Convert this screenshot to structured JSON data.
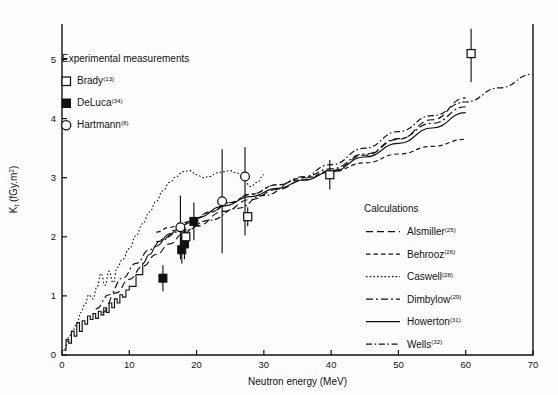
{
  "figure": {
    "name": "neutron-kerma-figure",
    "background": "#ffffff",
    "ink_color": "#111111"
  },
  "axes": {
    "x": {
      "label": "Neutron energy (MeV)",
      "min": 0,
      "max": 70,
      "ticks": [
        "0",
        "10",
        "20",
        "30",
        "40",
        "50",
        "60",
        "70"
      ],
      "tick_values": [
        0,
        10,
        20,
        30,
        40,
        50,
        60,
        70
      ]
    },
    "y": {
      "label_main": "K",
      "label_sub": "t",
      "label_units_open": " (fGy.m",
      "label_units_sup": "2",
      "label_units_close": ")",
      "label_full": "Kt (fGy.m2)",
      "min": 0,
      "max": 5.6,
      "ticks": [
        "0",
        "1",
        "2",
        "3",
        "4",
        "5"
      ],
      "tick_values": [
        0,
        1,
        2,
        3,
        4,
        5
      ]
    }
  },
  "legend_experimental": {
    "heading": "Experimental measurements",
    "items": [
      {
        "label": "Brady",
        "ref": "(13)",
        "marker": "open-square"
      },
      {
        "label": "DeLuca",
        "ref": "(34)",
        "marker": "filled-square"
      },
      {
        "label": "Hartmann",
        "ref": "(8)",
        "marker": "open-circle"
      }
    ]
  },
  "legend_calculations": {
    "heading": "Calculations",
    "items": [
      {
        "label": "Alsmiller",
        "ref": "(25)",
        "dash": "7 4",
        "width": 1.15
      },
      {
        "label": "Behrooz",
        "ref": "(26)",
        "dash": "4.5 3",
        "width": 1.15
      },
      {
        "label": "Caswell",
        "ref": "(28)",
        "dash": "1.6 2.1",
        "width": 1.1
      },
      {
        "label": "Dimbylow",
        "ref": "(29)",
        "dash": "7 3 2 3",
        "width": 1.15
      },
      {
        "label": "Howerton",
        "ref": "(31)",
        "dash": "none",
        "width": 1.15
      },
      {
        "label": "Wells",
        "ref": "(32)",
        "dash": "6 2.6 1.6 2.6",
        "width": 1.2
      }
    ]
  },
  "chart_data": {
    "type": "line",
    "title": "",
    "xlabel": "Neutron energy (MeV)",
    "ylabel": "Kt (fGy.m2)",
    "xlim": [
      0,
      70
    ],
    "ylim": [
      0,
      5.6
    ],
    "grid": false,
    "legend_position": "inside-upper-left and inside-lower-right",
    "series": [
      {
        "name": "Alsmiller",
        "ref": "(25)",
        "style": "dashed",
        "x": [
          6.0,
          8.0,
          10.0,
          12.0,
          14.0,
          16.0,
          18.0,
          20.0,
          24.0,
          28.0,
          32.0,
          36.0,
          40.0,
          45.0,
          50.0,
          55.0,
          60.0
        ],
        "y": [
          0.72,
          1.05,
          1.28,
          1.5,
          1.7,
          1.88,
          2.05,
          2.18,
          2.43,
          2.63,
          2.8,
          2.96,
          3.12,
          3.38,
          3.65,
          3.98,
          4.35
        ]
      },
      {
        "name": "Behrooz",
        "ref": "(26)",
        "style": "dashed-short",
        "x": [
          14.0,
          16.0,
          18.0,
          20.0,
          22.0,
          25.0,
          28.0,
          32.0,
          36.0,
          40.0,
          45.0,
          50.0,
          55.0,
          60.0
        ],
        "y": [
          2.08,
          2.16,
          2.24,
          2.32,
          2.42,
          2.58,
          2.72,
          2.88,
          3.0,
          3.1,
          3.25,
          3.4,
          3.53,
          3.65
        ]
      },
      {
        "name": "Caswell",
        "ref": "(28)",
        "style": "dotted",
        "x": [
          0.4,
          1.0,
          1.6,
          2.2,
          2.8,
          3.4,
          4.0,
          4.6,
          5.2,
          5.8,
          6.4,
          7.0,
          7.6,
          8.2,
          9.0,
          10.0,
          11.0,
          12.0,
          13.0,
          14.0,
          15.0,
          16.0,
          17.0,
          18.0,
          19.0,
          20.0,
          21.0,
          22.0,
          23.0,
          24.0,
          25.0,
          26.0,
          27.0,
          28.0,
          29.0,
          30.0
        ],
        "y": [
          0.1,
          0.3,
          0.42,
          0.52,
          0.72,
          0.85,
          1.02,
          0.95,
          1.15,
          1.38,
          1.18,
          1.42,
          1.22,
          1.48,
          1.62,
          1.8,
          2.02,
          2.22,
          2.42,
          2.6,
          2.78,
          2.92,
          3.02,
          3.1,
          3.12,
          3.05,
          3.0,
          3.02,
          3.08,
          3.1,
          3.12,
          3.08,
          2.98,
          2.85,
          2.92,
          3.05
        ]
      },
      {
        "name": "Dimbylow",
        "ref": "(29)",
        "style": "dash-dot",
        "x": [
          5.0,
          7.0,
          9.0,
          11.0,
          13.0,
          15.0,
          17.0,
          19.0,
          22.0,
          25.0,
          28.0,
          32.0,
          36.0,
          40.0,
          45.0,
          50.0,
          55.0,
          60.0
        ],
        "y": [
          0.78,
          1.02,
          1.3,
          1.55,
          1.78,
          1.96,
          2.12,
          2.24,
          2.42,
          2.58,
          2.72,
          2.88,
          3.02,
          3.15,
          3.4,
          3.66,
          3.92,
          4.2
        ]
      },
      {
        "name": "Howerton",
        "ref": "(31)",
        "style": "solid",
        "note": "jagged staircase at low energy, smooth above ~12 MeV",
        "x": [
          0.2,
          0.6,
          1.0,
          1.4,
          1.8,
          2.2,
          2.6,
          3.0,
          3.4,
          3.8,
          4.2,
          4.6,
          5.0,
          5.4,
          5.8,
          6.2,
          6.6,
          7.0,
          7.4,
          7.8,
          8.2,
          8.6,
          9.0,
          9.5,
          10.0,
          11.0,
          12.0,
          13.0,
          14.0,
          16.0,
          18.0,
          20.0,
          24.0,
          28.0,
          32.0,
          36.0,
          40.0,
          45.0,
          50.0,
          55.0,
          60.0
        ],
        "y": [
          0.08,
          0.26,
          0.2,
          0.4,
          0.32,
          0.55,
          0.4,
          0.58,
          0.52,
          0.66,
          0.6,
          0.7,
          0.62,
          0.74,
          0.68,
          0.8,
          0.72,
          0.88,
          0.8,
          0.95,
          0.88,
          1.02,
          0.98,
          1.1,
          1.16,
          1.36,
          1.55,
          1.7,
          1.84,
          2.05,
          2.2,
          2.32,
          2.52,
          2.68,
          2.82,
          2.96,
          3.1,
          3.35,
          3.58,
          3.84,
          4.1
        ]
      },
      {
        "name": "Wells",
        "ref": "(32)",
        "style": "long-dash-dot",
        "x": [
          14.0,
          18.0,
          22.0,
          26.0,
          30.0,
          35.0,
          40.0,
          45.0,
          50.0,
          55.0,
          60.0,
          65.0,
          70.0
        ],
        "y": [
          1.92,
          2.1,
          2.28,
          2.48,
          2.7,
          2.96,
          3.22,
          3.5,
          3.78,
          4.05,
          4.28,
          4.52,
          4.75
        ]
      }
    ],
    "experimental_points": [
      {
        "series": "DeLuca",
        "marker": "filled-square",
        "x": 15.0,
        "y": 1.3,
        "yerr_low": 1.08,
        "yerr_high": 1.52
      },
      {
        "series": "DeLuca",
        "marker": "filled-square",
        "x": 17.8,
        "y": 1.78,
        "yerr_low": 1.55,
        "yerr_high": 2.02
      },
      {
        "series": "DeLuca",
        "marker": "filled-square",
        "x": 18.2,
        "y": 1.88,
        "yerr_low": 1.62,
        "yerr_high": 2.14
      },
      {
        "series": "DeLuca",
        "marker": "filled-square",
        "x": 19.6,
        "y": 2.26,
        "yerr_low": 1.94,
        "yerr_high": 2.58
      },
      {
        "series": "Hartmann",
        "marker": "open-circle",
        "x": 17.6,
        "y": 2.16,
        "yerr_low": 1.62,
        "yerr_high": 2.7
      },
      {
        "series": "Hartmann",
        "marker": "open-circle",
        "x": 23.8,
        "y": 2.6,
        "yerr_low": 1.72,
        "yerr_high": 3.48
      },
      {
        "series": "Hartmann",
        "marker": "open-circle",
        "x": 27.2,
        "y": 3.02,
        "yerr_low": 2.02,
        "yerr_high": 3.52
      },
      {
        "series": "Brady",
        "marker": "open-square",
        "x": 18.4,
        "y": 2.0,
        "yerr_low": 1.86,
        "yerr_high": 2.14
      },
      {
        "series": "Brady",
        "marker": "open-square",
        "x": 27.6,
        "y": 2.34,
        "yerr_low": 2.18,
        "yerr_high": 2.5
      },
      {
        "series": "Brady",
        "marker": "open-square",
        "x": 39.8,
        "y": 3.05,
        "yerr_low": 2.8,
        "yerr_high": 3.3
      },
      {
        "series": "Brady",
        "marker": "open-square",
        "x": 60.8,
        "y": 5.1,
        "yerr_low": 4.62,
        "yerr_high": 5.52
      }
    ]
  }
}
